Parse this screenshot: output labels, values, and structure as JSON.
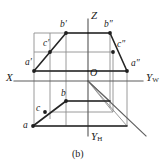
{
  "figure": {
    "caption": "(b)",
    "axes": [
      {
        "id": "x",
        "label": "X",
        "sub": "",
        "x": 6,
        "y": 72
      },
      {
        "id": "z",
        "label": "Z",
        "sub": "",
        "x": 91,
        "y": 10
      },
      {
        "id": "yw",
        "label": "Y",
        "sub": "W",
        "x": 146,
        "y": 72
      },
      {
        "id": "yh",
        "label": "Y",
        "sub": "H",
        "x": 91,
        "y": 138
      }
    ],
    "origin": {
      "label": "O",
      "x": 89,
      "y": 70
    },
    "vertices": [
      {
        "id": "b-prime",
        "label": "b",
        "marks": "′",
        "x": 60,
        "y": 23
      },
      {
        "id": "b-double-prime",
        "label": "b",
        "marks": "″",
        "x": 104,
        "y": 23
      },
      {
        "id": "c-prime",
        "label": "c",
        "marks": "′",
        "x": 44,
        "y": 42
      },
      {
        "id": "c-double-prime",
        "label": "c",
        "marks": "″",
        "x": 118,
        "y": 43
      },
      {
        "id": "a-prime",
        "label": "a",
        "marks": "′",
        "x": 27,
        "y": 60
      },
      {
        "id": "a-double-prime",
        "label": "a",
        "marks": "″",
        "x": 132,
        "y": 61
      },
      {
        "id": "b-plan",
        "label": "b",
        "marks": "",
        "x": 61,
        "y": 92
      },
      {
        "id": "c-plan",
        "label": "c",
        "marks": "",
        "x": 37,
        "y": 107
      },
      {
        "id": "a-plan",
        "label": "a",
        "marks": "",
        "x": 24,
        "y": 124
      }
    ],
    "colors": {
      "stroke_heavy": "#2b2b2b",
      "stroke_light": "#8a8a8a",
      "text": "#1a1a1a",
      "background": "#ffffff"
    },
    "geometry": {
      "origin_point": [
        88,
        81
      ],
      "x_axis": [
        [
          14,
          81
        ],
        [
          88,
          81
        ]
      ],
      "yw_axis": [
        [
          88,
          81
        ],
        [
          143,
          81
        ]
      ],
      "z_axis": [
        [
          88,
          19
        ],
        [
          88,
          81
        ]
      ],
      "yh_axis": [
        [
          88,
          81
        ],
        [
          88,
          136
        ]
      ],
      "y_oblique": [
        [
          88,
          81
        ],
        [
          145,
          135
        ]
      ],
      "front_view": {
        "a_prime": [
          34,
          71
        ],
        "b_prime": [
          66,
          33
        ],
        "c_prime": [
          50,
          52
        ],
        "base_right": [
          88,
          71
        ],
        "top_right": [
          88,
          33
        ]
      },
      "side_view": {
        "a_dprime": [
          127,
          71
        ],
        "b_dprime": [
          110,
          33
        ],
        "c_dprime": [
          113,
          52
        ],
        "base_left": [
          88,
          71
        ],
        "top_left": [
          88,
          33
        ]
      },
      "top_view": {
        "a": [
          33,
          126
        ],
        "b": [
          66,
          101
        ],
        "c": [
          45,
          112
        ],
        "right_lower": [
          126,
          126
        ],
        "right_upper": [
          104,
          101
        ]
      }
    }
  }
}
